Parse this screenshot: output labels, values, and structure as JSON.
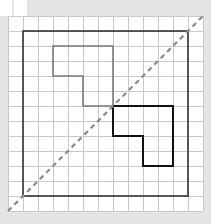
{
  "diagram": {
    "background_color": "#e4e4e4",
    "grid": {
      "origin_px": [
        8,
        16
      ],
      "cell_px": 15,
      "columns": 13,
      "rows": 13,
      "paper_color": "#ffffff",
      "line_color": "#c8c8c8"
    },
    "top_tab": {
      "x": 0,
      "y": 0,
      "width": 27,
      "height": 16,
      "divider_x": 13
    },
    "outer_square": {
      "from_cell": [
        1,
        1
      ],
      "to_cell": [
        12,
        12
      ],
      "color": "#333333",
      "stroke_width": 1.6
    },
    "reflection_line": {
      "style": "dashed",
      "from_cell": [
        0,
        13
      ],
      "to_cell": [
        13,
        0
      ],
      "color": "#8a8a8a",
      "stroke_width": 2.2,
      "dash": "5 4"
    },
    "shapes": [
      {
        "name": "original-l-shape",
        "color": "#7a7a7a",
        "stroke_width": 1.6,
        "points_cells": [
          [
            3,
            2
          ],
          [
            7,
            2
          ],
          [
            7,
            6
          ],
          [
            5,
            6
          ],
          [
            5,
            4
          ],
          [
            3,
            4
          ]
        ]
      },
      {
        "name": "reflected-l-shape",
        "color": "#111111",
        "stroke_width": 2,
        "points_cells": [
          [
            7,
            6
          ],
          [
            11,
            6
          ],
          [
            11,
            10
          ],
          [
            9,
            10
          ],
          [
            9,
            8
          ],
          [
            7,
            8
          ]
        ]
      }
    ]
  }
}
